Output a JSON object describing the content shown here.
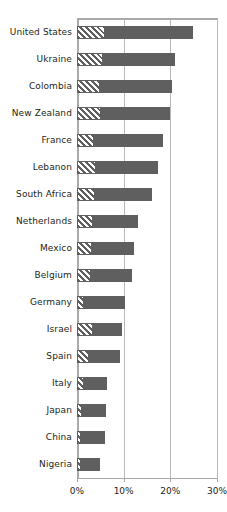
{
  "chart_data": {
    "type": "bar",
    "orientation": "horizontal",
    "title": "",
    "subtitle": "",
    "xlabel": "",
    "ylabel": "",
    "xlim": [
      0,
      30
    ],
    "xticks": [
      0,
      10,
      20,
      30
    ],
    "xtick_labels": [
      "0%",
      "10%",
      "20%",
      "30%"
    ],
    "grid": "vertical",
    "legend": "none",
    "value_unit": "%",
    "categories": [
      "United States",
      "Ukraine",
      "Colombia",
      "New Zealand",
      "France",
      "Lebanon",
      "South Africa",
      "Netherlands",
      "Mexico",
      "Belgium",
      "Germany",
      "Israel",
      "Spain",
      "Italy",
      "Japan",
      "China",
      "Nigeria"
    ],
    "values": [
      24.9,
      21.0,
      20.4,
      20.0,
      18.4,
      17.4,
      16.1,
      13.1,
      12.2,
      11.8,
      10.3,
      9.6,
      9.2,
      6.4,
      6.2,
      6.0,
      4.9
    ],
    "series": [
      {
        "name": "Hatched segment",
        "style": "diagonal-hatch",
        "color": "#5f5f5f",
        "values": [
          6.0,
          5.6,
          5.0,
          5.2,
          3.6,
          4.0,
          3.9,
          3.4,
          3.2,
          3.0,
          1.6,
          3.4,
          2.6,
          1.4,
          1.0,
          0.9,
          0.9
        ]
      },
      {
        "name": "Solid segment",
        "style": "solid",
        "color": "#5f5f5f",
        "values": [
          18.9,
          15.4,
          15.4,
          14.8,
          14.8,
          13.4,
          12.2,
          9.7,
          9.0,
          8.8,
          8.7,
          6.2,
          6.6,
          5.0,
          5.2,
          5.1,
          4.0
        ]
      }
    ]
  },
  "colors": {
    "bar": "#5f5f5f",
    "grid": "#b9b9b9",
    "axis": "#a9a9a9",
    "text": "#231f20",
    "background": "#ffffff"
  }
}
